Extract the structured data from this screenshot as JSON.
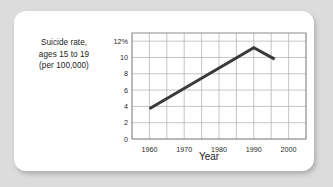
{
  "card": {
    "background": "#ffffff",
    "page_background": "#dcdcdc"
  },
  "chart_data": {
    "type": "line",
    "title": "",
    "ylabel_lines": [
      "Suicide rate,",
      "ages 15 to 19",
      "(per 100,000)"
    ],
    "ylabel": "Suicide rate, ages 15 to 19 (per 100,000)",
    "xlabel": "Year",
    "x": [
      1960,
      1990,
      1996
    ],
    "values": [
      3.7,
      11.2,
      9.8
    ],
    "series": [
      {
        "name": "Suicide rate, ages 15 to 19 (per 100,000)",
        "x": [
          1960,
          1990,
          1996
        ],
        "values": [
          3.7,
          11.2,
          9.8
        ],
        "color": "#3a3a3a"
      }
    ],
    "xlim": [
      1955,
      2005
    ],
    "ylim": [
      0,
      13
    ],
    "ytick_values": [
      0,
      2,
      4,
      6,
      8,
      10,
      12
    ],
    "ytick_labels": [
      "0",
      "2",
      "4",
      "6",
      "8",
      "10",
      "12%"
    ],
    "xtick_values": [
      1960,
      1970,
      1980,
      1990,
      2000
    ],
    "xtick_labels": [
      "1960",
      "1970",
      "1980",
      "1990",
      "2000"
    ],
    "xgrid_values": [
      1955,
      1960,
      1965,
      1970,
      1975,
      1980,
      1985,
      1990,
      1995,
      2000,
      2005
    ],
    "grid": true,
    "legend": "none",
    "line_color": "#3a3a3a",
    "grid_color": "#b6b6b6",
    "frame_color": "#8e8e8e"
  }
}
